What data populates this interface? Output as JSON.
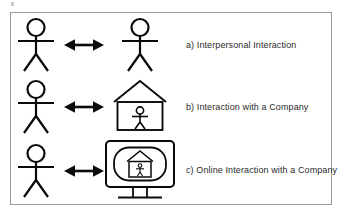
{
  "figure": {
    "background_color": "#ffffff",
    "ink_color": "#0a0a0a",
    "frame_color": "#9a9a9a",
    "text_color": "#2b2b2b",
    "rows": [
      {
        "id": "a",
        "label": "a) Interpersonal Interaction",
        "left_glyph": "stick-figure-person",
        "connector": "double-headed-arrow",
        "right_glyph": "stick-figure-person"
      },
      {
        "id": "b",
        "label": "b) Interaction with a Company",
        "left_glyph": "stick-figure-person",
        "connector": "double-headed-arrow",
        "right_glyph": "house-with-person"
      },
      {
        "id": "c",
        "label": "c) Online Interaction with a Company",
        "left_glyph": "stick-figure-person",
        "connector": "double-headed-arrow",
        "right_glyph": "computer-monitor-with-house-and-person"
      }
    ]
  }
}
